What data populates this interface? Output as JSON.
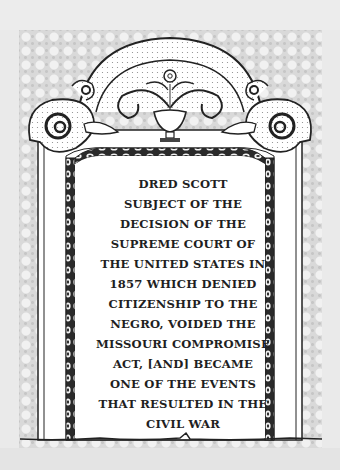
{
  "image": {
    "subject": "engraved headstone / memorial tablet illustration",
    "colors": {
      "background": "#e9e9e9",
      "stipple": "#d9d9d9",
      "stone_face": "#ffffff",
      "ink": "#1f1f1f"
    }
  },
  "headstone": {
    "ornament": {
      "top": "urn with rosette flower and leaf fronds",
      "sides": "scroll volutes",
      "border": "beaded / egg-and-dart frame"
    },
    "inscription": {
      "lines": [
        "DRED SCOTT",
        "SUBJECT OF THE",
        "DECISION OF THE",
        "SUPREME COURT OF",
        "THE UNITED STATES IN",
        "1857 WHICH DENIED",
        "CITIZENSHIP TO THE",
        "NEGRO, VOIDED THE",
        "MISSOURI COMPROMISE",
        "ACT, [AND] BECAME",
        "ONE OF THE EVENTS",
        "THAT RESULTED IN THE",
        "CIVIL WAR"
      ]
    }
  }
}
